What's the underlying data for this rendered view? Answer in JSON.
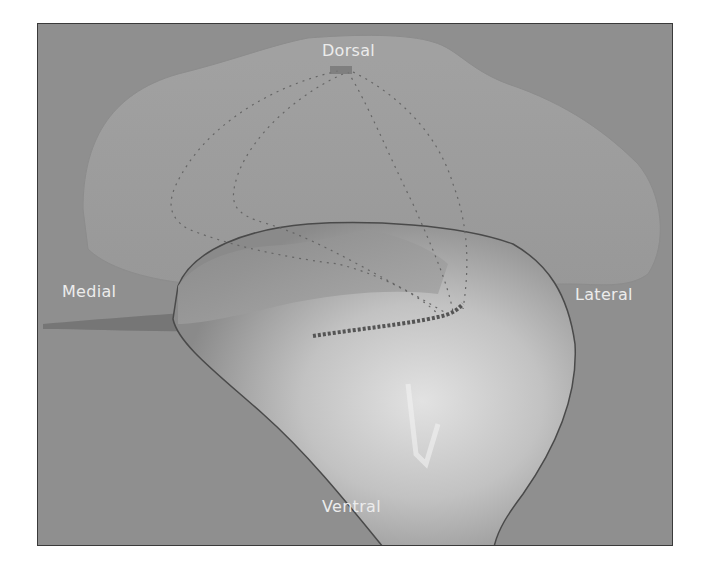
{
  "figure": {
    "background_color": "#8f8f8f",
    "labels": {
      "dorsal": "Dorsal",
      "medial": "Medial",
      "lateral": "Lateral",
      "ventral": "Ventral"
    }
  }
}
